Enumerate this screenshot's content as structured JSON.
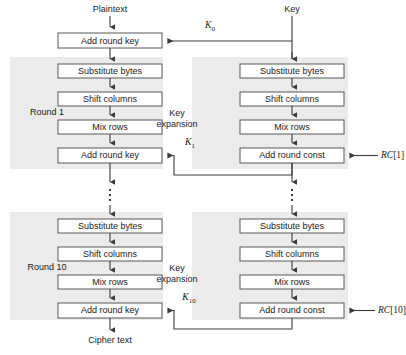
{
  "diagram": {
    "colors": {
      "shade": "#ebebeb",
      "box_fill": "#ffffff",
      "box_stroke": "#58595b",
      "connector": "#3a3a3a",
      "text": "#1a1a1a",
      "background": "#ffffff"
    },
    "terminals": {
      "plaintext": "Plaintext",
      "key": "Key",
      "ciphertext": "Cipher text"
    },
    "group_labels": {
      "round_1": "Round 1",
      "round_10": "Round 10",
      "key_expansion_line1": "Key",
      "key_expansion_line2": "expansion"
    },
    "initial_stage": {
      "box_label": "Add round key",
      "key_input": "K",
      "key_input_sub": "0"
    },
    "round_1": {
      "cipher_boxes": [
        "Substitute bytes",
        "Shift columns",
        "Mix rows",
        "Add round key"
      ],
      "key_boxes": [
        "Substitute bytes",
        "Shift columns",
        "Mix rows",
        "Add round const"
      ],
      "round_key": "K",
      "round_key_sub": "1",
      "round_const": "RC",
      "round_const_index": "[1]"
    },
    "round_10": {
      "cipher_boxes": [
        "Substitute bytes",
        "Shift columns",
        "Mix rows",
        "Add round key"
      ],
      "key_boxes": [
        "Substitute bytes",
        "Shift columns",
        "Mix rows",
        "Add round const"
      ],
      "round_key": "K",
      "round_key_sub": "10",
      "round_const": "RC",
      "round_const_index": "[10]"
    },
    "ellipsis": {
      "symbol": "vertical-ellipsis",
      "left_column_present": true,
      "right_column_present": true
    }
  }
}
